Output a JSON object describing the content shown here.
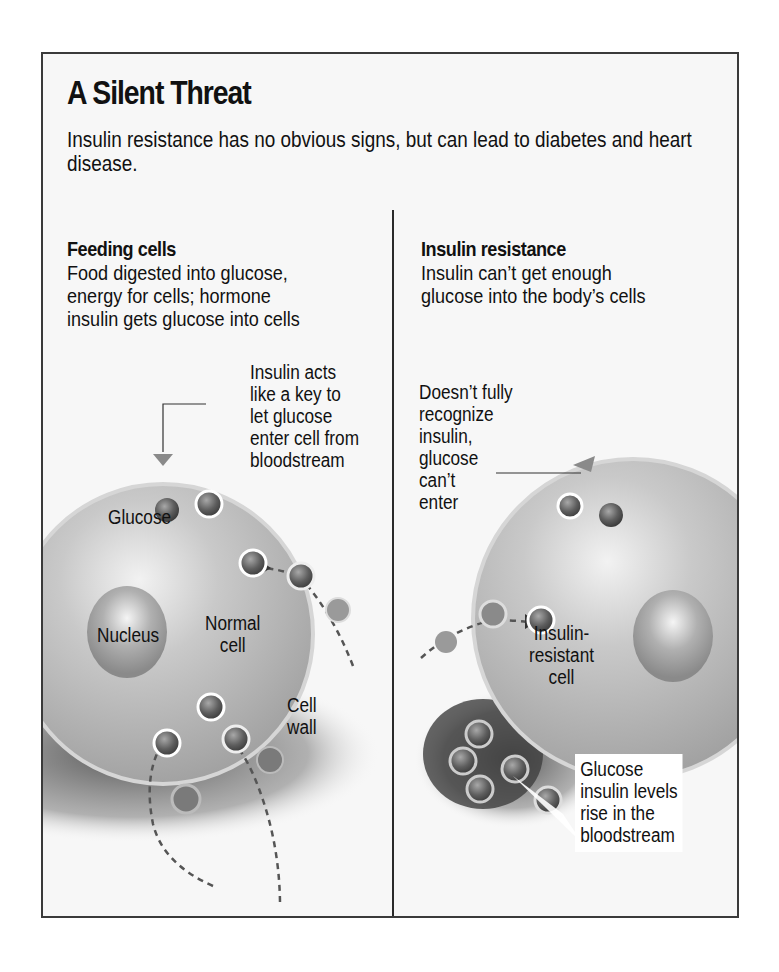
{
  "title": "A Silent Threat",
  "subtitle": "Insulin resistance has no obvious signs, but can lead to diabetes and heart disease.",
  "left_panel": {
    "heading": "Feeding cells",
    "description": "Food digested into glucose,\nenergy for cells; hormone\ninsulin gets glucose into cells",
    "callout": "Insulin acts\nlike a key to\nlet glucose\nenter cell from\nbloodstream",
    "labels": {
      "glucose": "Glucose",
      "nucleus": "Nucleus",
      "cell": "Normal\ncell",
      "cell_wall": "Cell\nwall"
    }
  },
  "right_panel": {
    "heading": "Insulin resistance",
    "description": "Insulin can’t get enough\nglucose into the body’s cells",
    "callout": "Doesn’t fully\nrecognize\ninsulin,\nglucose\ncan’t\nenter",
    "labels": {
      "cell": "Insulin-\nresistant\ncell",
      "bloodstream_note": "Glucose\ninsulin levels\nrise in the\nbloodstream"
    }
  },
  "colors": {
    "frame_border": "#3a3a3a",
    "cell_fill": "#b5b5b5",
    "glucose_fill": "#6e6e6e",
    "background": "#f7f7f7"
  }
}
